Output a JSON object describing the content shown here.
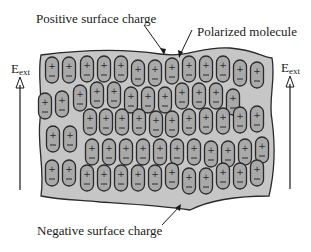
{
  "diagram": {
    "labels": {
      "positive_surface_charge": "Positive surface charge",
      "polarized_molecule": "Polarized molecule",
      "negative_surface_charge": "Negative surface charge",
      "field_left": {
        "symbol": "E",
        "subscript": "ext"
      },
      "field_right": {
        "symbol": "E",
        "subscript": "ext"
      }
    },
    "molecule": {
      "top_sign": "+",
      "bottom_sign": "−"
    },
    "colors": {
      "background": "#ffffff",
      "dielectric_fill": "#c6c6c6",
      "molecule_fill": "#a9a9a9",
      "outline": "#2a2a2a",
      "text": "#1a1a1a"
    },
    "molecule_count": 89
  }
}
